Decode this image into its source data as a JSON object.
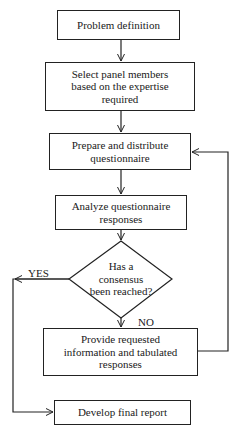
{
  "diagram": {
    "type": "flowchart",
    "nodes": [
      {
        "id": "problem",
        "shape": "rect",
        "text": "Problem definition"
      },
      {
        "id": "select",
        "shape": "rect",
        "text": "Select panel members based on the expertise required"
      },
      {
        "id": "prepare",
        "shape": "rect",
        "text": "Prepare and distribute questionnaire"
      },
      {
        "id": "analyze",
        "shape": "rect",
        "text": "Analyze questionnaire responses"
      },
      {
        "id": "decision",
        "shape": "diamond",
        "text": "Has a consensus been reached?"
      },
      {
        "id": "provide",
        "shape": "rect",
        "text": "Provide requested information and tabulated responses"
      },
      {
        "id": "final",
        "shape": "rect",
        "text": "Develop final report"
      }
    ],
    "edges": [
      {
        "from": "problem",
        "to": "select",
        "label": ""
      },
      {
        "from": "select",
        "to": "prepare",
        "label": ""
      },
      {
        "from": "prepare",
        "to": "analyze",
        "label": ""
      },
      {
        "from": "analyze",
        "to": "decision",
        "label": ""
      },
      {
        "from": "decision",
        "to": "provide",
        "label": "NO"
      },
      {
        "from": "decision",
        "to": "final",
        "label": "YES"
      },
      {
        "from": "provide",
        "to": "prepare",
        "label": ""
      }
    ],
    "labels": {
      "yes": "YES",
      "no": "NO"
    }
  }
}
